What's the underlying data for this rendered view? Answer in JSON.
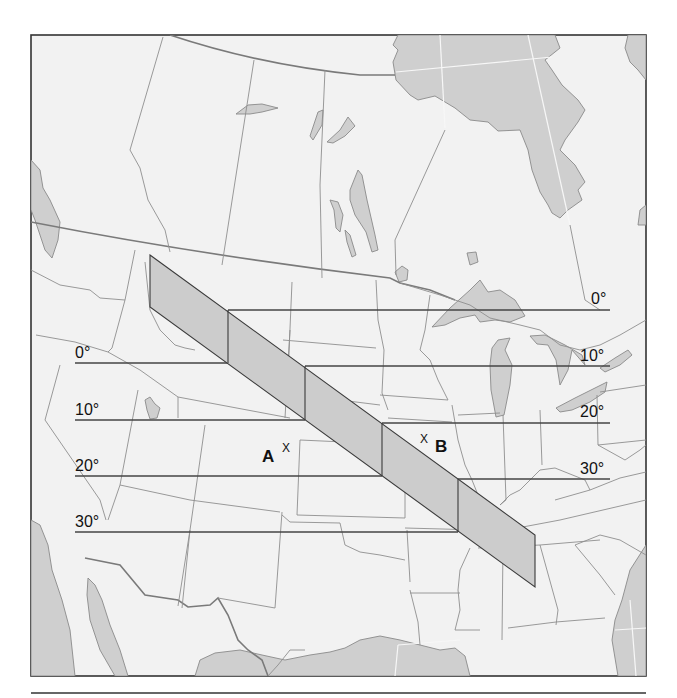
{
  "figure": {
    "frame": {
      "x": 31,
      "y": 35,
      "width": 615,
      "height": 641
    },
    "separator": {
      "x1": 31,
      "x2": 646,
      "y": 693
    },
    "colors": {
      "land": "#f2f2f2",
      "water": "#cfcfcf",
      "band": "#cccccc",
      "lines": "#444444",
      "text": "#111111"
    }
  },
  "isotherms": [
    {
      "label": "0°",
      "left": {
        "x1": 75,
        "x2": 228,
        "y": 363
      },
      "right": {
        "x1": 228,
        "x2": 610,
        "y": 310
      },
      "left_label_pos": {
        "x": 75,
        "y": 358
      },
      "right_label_pos": {
        "x": 591,
        "y": 304
      }
    },
    {
      "label": "10°",
      "left": {
        "x1": 75,
        "x2": 305,
        "y": 420
      },
      "right": {
        "x1": 305,
        "x2": 610,
        "y": 366
      },
      "left_label_pos": {
        "x": 75,
        "y": 415
      },
      "right_label_pos": {
        "x": 580,
        "y": 361
      }
    },
    {
      "label": "20°",
      "left": {
        "x1": 75,
        "x2": 382,
        "y": 476
      },
      "right": {
        "x1": 382,
        "x2": 610,
        "y": 423
      },
      "left_label_pos": {
        "x": 75,
        "y": 471
      },
      "right_label_pos": {
        "x": 580,
        "y": 417
      }
    },
    {
      "label": "30°",
      "left": {
        "x1": 75,
        "x2": 458,
        "y": 532
      },
      "right": {
        "x1": 458,
        "x2": 610,
        "y": 479
      },
      "left_label_pos": {
        "x": 75,
        "y": 527
      },
      "right_label_pos": {
        "x": 580,
        "y": 474
      }
    }
  ],
  "band": {
    "polygon": [
      [
        150,
        255
      ],
      [
        535,
        535
      ],
      [
        535,
        587
      ],
      [
        150,
        307
      ]
    ],
    "dividers": [
      {
        "x": 228,
        "y1": 310,
        "y2": 363
      },
      {
        "x": 305,
        "y1": 366,
        "y2": 420
      },
      {
        "x": 382,
        "y1": 423,
        "y2": 476
      },
      {
        "x": 458,
        "y1": 479,
        "y2": 532
      }
    ]
  },
  "points": [
    {
      "id": "A",
      "letter": "A",
      "mark": "X",
      "letter_pos": {
        "x": 262,
        "y": 462
      },
      "mark_pos": {
        "x": 282,
        "y": 452
      }
    },
    {
      "id": "B",
      "letter": "B",
      "mark": "X",
      "letter_pos": {
        "x": 435,
        "y": 452
      },
      "mark_pos": {
        "x": 420,
        "y": 443
      }
    }
  ]
}
